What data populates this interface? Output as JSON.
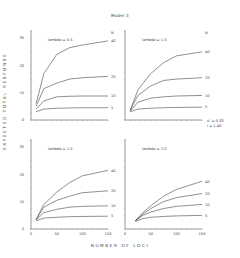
{
  "chart_data": [
    {
      "type": "line",
      "title": "lambda = 0.5",
      "xlabel": "NUMBER OF LOCI",
      "ylabel": "EXPECTED TOTAL RESPONSE",
      "xlim": [
        0,
        150
      ],
      "ylim": [
        0,
        33
      ],
      "yticks": [
        0,
        10,
        20,
        30
      ],
      "x": [
        10,
        25,
        50,
        75,
        100,
        150
      ],
      "legend_title": "N",
      "series": [
        {
          "name": "40",
          "values": [
            6,
            17,
            24,
            26.5,
            27.5,
            29
          ]
        },
        {
          "name": "20",
          "values": [
            5,
            11.5,
            13.5,
            15,
            15.5,
            16
          ]
        },
        {
          "name": "10",
          "values": [
            4,
            7,
            8.5,
            8.7,
            8.8,
            8.8
          ]
        },
        {
          "name": "5",
          "values": [
            3,
            4,
            4.3,
            4.4,
            4.5,
            4.5
          ]
        }
      ]
    },
    {
      "type": "line",
      "title": "lambda = 1.0",
      "xlabel": "NUMBER OF LOCI",
      "ylabel": "EXPECTED TOTAL RESPONSE",
      "xlim": [
        0,
        150
      ],
      "ylim": [
        0,
        33
      ],
      "x": [
        10,
        25,
        50,
        75,
        100,
        150
      ],
      "legend_title": "N",
      "series": [
        {
          "name": "40",
          "values": [
            3.5,
            11,
            17,
            21,
            23.5,
            25
          ]
        },
        {
          "name": "20",
          "values": [
            3.5,
            9,
            12.5,
            14.5,
            15,
            15.5
          ]
        },
        {
          "name": "10",
          "values": [
            3.2,
            6.5,
            8,
            8.5,
            8.8,
            9
          ]
        },
        {
          "name": "5",
          "values": [
            3,
            4,
            4.3,
            4.5,
            4.6,
            4.7
          ]
        }
      ]
    },
    {
      "type": "line",
      "title": "lambda = 1.5",
      "xlabel": "NUMBER OF LOCI",
      "ylabel": "EXPECTED TOTAL RESPONSE",
      "xlim": [
        0,
        150
      ],
      "ylim": [
        0,
        33
      ],
      "yticks": [
        0,
        10,
        20,
        30
      ],
      "xticks": [
        0,
        50,
        100,
        150
      ],
      "x": [
        10,
        25,
        50,
        75,
        100,
        150
      ],
      "legend_title": "N",
      "series": [
        {
          "name": "40",
          "values": [
            3.5,
            9,
            13.5,
            17,
            19.5,
            21.5
          ]
        },
        {
          "name": "20",
          "values": [
            3.5,
            8,
            10.5,
            12,
            13.3,
            14
          ]
        },
        {
          "name": "10",
          "values": [
            3.3,
            6,
            7.2,
            8,
            8.3,
            8.5
          ]
        },
        {
          "name": "5",
          "values": [
            3,
            4,
            4.3,
            4.5,
            4.6,
            4.7
          ]
        }
      ]
    },
    {
      "type": "line",
      "title": "lambda = 2.0",
      "xlabel": "NUMBER OF LOCI",
      "ylabel": "EXPECTED TOTAL RESPONSE",
      "xlim": [
        0,
        150
      ],
      "ylim": [
        0,
        33
      ],
      "xticks": [
        0,
        50,
        100,
        150
      ],
      "x": [
        20,
        35,
        50,
        75,
        100,
        150
      ],
      "legend_title": "N",
      "series": [
        {
          "name": "40",
          "values": [
            3,
            6,
            8.5,
            12,
            14.5,
            17.5
          ]
        },
        {
          "name": "20",
          "values": [
            3,
            5.5,
            7.5,
            10,
            11.5,
            13
          ]
        },
        {
          "name": "10",
          "values": [
            3,
            5,
            6.2,
            7.5,
            8.3,
            9
          ]
        },
        {
          "name": "5",
          "values": [
            2.8,
            3.8,
            4.3,
            4.6,
            4.8,
            5
          ]
        }
      ]
    }
  ],
  "figure": {
    "title": "Model 3",
    "xlabel": "NUMBER OF LOCI",
    "ylabel": "EXPECTED TOTAL RESPONSE",
    "annotation_line1": "s² = 0.33",
    "annotation_line2": "i = 1.40",
    "panels": [
      {
        "label": "lambda = 0.5",
        "legend_title": "N",
        "line_labels": [
          "40",
          "20",
          "10",
          "5"
        ],
        "yticks": [
          "30",
          "20",
          "10",
          "0"
        ]
      },
      {
        "label": "lambda = 1.0",
        "legend_title": "N",
        "line_labels": [
          "40",
          "20",
          "10",
          "5"
        ]
      },
      {
        "label": "lambda = 1.5",
        "line_labels": [
          "40",
          "20",
          "10",
          "5"
        ],
        "yticks": [
          "30",
          "20",
          "10",
          "0"
        ],
        "xticks": [
          "0",
          "50",
          "100",
          "150"
        ]
      },
      {
        "label": "lambda = 2.0",
        "line_labels": [
          "40",
          "20",
          "10",
          "5"
        ],
        "xticks": [
          "0",
          "50",
          "100",
          "150"
        ]
      }
    ]
  }
}
